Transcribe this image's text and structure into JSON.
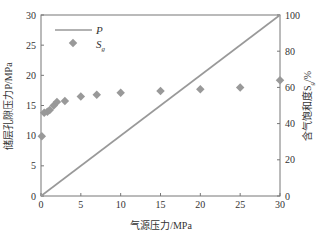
{
  "chart_data": {
    "type": "scatter",
    "title": "",
    "xlabel": "气源压力/MPa",
    "ylabel": "储层孔隙压力P/MPa",
    "y2label": "含气饱和度Sg/%",
    "xlim": [
      0,
      30
    ],
    "ylim": [
      0,
      30
    ],
    "y2lim": [
      0,
      100
    ],
    "xticks": [
      0,
      5,
      10,
      15,
      20,
      25,
      30
    ],
    "yticks": [
      0,
      5,
      10,
      15,
      20,
      25,
      30
    ],
    "y2ticks": [
      0,
      20,
      40,
      60,
      80,
      100
    ],
    "grid": false,
    "legend_position": "upper-left",
    "series": [
      {
        "name": "P",
        "type": "line",
        "axis": "left",
        "color": "#999999",
        "x": [
          0,
          30
        ],
        "y": [
          0,
          30
        ]
      },
      {
        "name": "Sg",
        "type": "scatter",
        "marker": "diamond",
        "axis": "right",
        "color": "#999999",
        "x": [
          0.1,
          0.4,
          0.8,
          1.1,
          1.6,
          2,
          3,
          5,
          7,
          10,
          15,
          20,
          25,
          30
        ],
        "y": [
          33,
          46,
          46.5,
          47.5,
          50,
          52,
          52.5,
          55,
          56,
          57,
          58,
          59,
          60,
          64
        ]
      }
    ]
  },
  "legend": {
    "p_label": "P",
    "sg_label": "S",
    "sg_sub": "g"
  },
  "axes": {
    "xlabel": "气源压力/MPa",
    "ylabel": "储层孔隙压力P/MPa",
    "y2label": "含气饱和度S",
    "y2label_sub": "g",
    "y2label_unit": "/%"
  }
}
